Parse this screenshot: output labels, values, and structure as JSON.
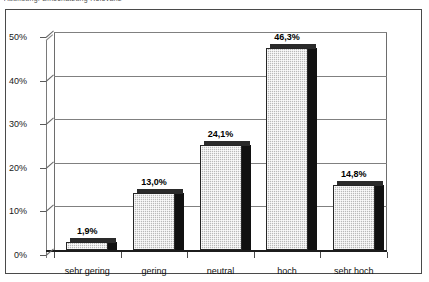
{
  "caption": {
    "text": "Abbildung: Einschätzung Relevanz"
  },
  "chart_data": {
    "type": "bar",
    "title": "",
    "subtitle": "",
    "xlabel": "",
    "ylabel": "",
    "categories": [
      "sehr gering",
      "gering",
      "neutral",
      "hoch",
      "sehr hoch"
    ],
    "values": [
      1.9,
      13.0,
      24.1,
      46.3,
      14.8
    ],
    "data_labels": [
      "1,9%",
      "13,0%",
      "24,1%",
      "46,3%",
      "14,8%"
    ],
    "ylim": [
      0,
      50
    ],
    "ytick_values": [
      0,
      10,
      20,
      30,
      40,
      50
    ],
    "ytick_labels": [
      "0%",
      "10%",
      "20%",
      "30%",
      "40%",
      "50%"
    ],
    "grid": true,
    "legend": "none",
    "series": [
      {
        "name": "Anteil",
        "values": [
          1.9,
          13.0,
          24.1,
          46.3,
          14.8
        ]
      }
    ],
    "style": {
      "bar_face_color": "#b9b9b9",
      "bar_edge_color": "#262626",
      "bar_shadow_color": "#111111",
      "axis_color": "#4a4a4a",
      "grid_color": "#808080",
      "background_color": "#ffffff",
      "three_d": true
    }
  }
}
